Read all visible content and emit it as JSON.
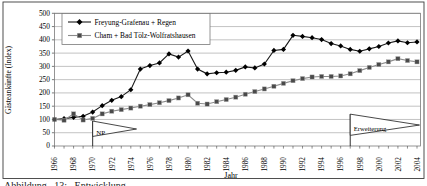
{
  "figure": {
    "caption_fragment": "Abbildung 13: Entwicklung"
  },
  "chart_data": {
    "type": "line",
    "title": "",
    "xlabel": "Jahr",
    "ylabel": "Gästeankünfte (Index)",
    "ylim": [
      0,
      500
    ],
    "ytick_step": 50,
    "grid": "horizontal",
    "legend_position": "top-left-inside",
    "x": [
      1966,
      1967,
      1968,
      1969,
      1970,
      1971,
      1972,
      1973,
      1974,
      1975,
      1976,
      1977,
      1978,
      1979,
      1980,
      1981,
      1982,
      1983,
      1984,
      1985,
      1986,
      1987,
      1988,
      1989,
      1990,
      1991,
      1992,
      1993,
      1994,
      1995,
      1996,
      1997,
      1998,
      1999,
      2000,
      2001,
      2002,
      2003,
      2004
    ],
    "xtick_labels": [
      1966,
      1968,
      1970,
      1972,
      1974,
      1976,
      1978,
      1980,
      1982,
      1984,
      1986,
      1988,
      1990,
      1992,
      1994,
      1996,
      1998,
      2000,
      2002,
      2004
    ],
    "series": [
      {
        "name": "Freyung-Grafenau + Regen",
        "marker": "diamond",
        "marker_color": "#000000",
        "line_color": "#1a1a1a",
        "values": [
          100,
          103,
          108,
          112,
          128,
          152,
          172,
          186,
          212,
          290,
          303,
          313,
          347,
          335,
          358,
          290,
          272,
          276,
          278,
          285,
          298,
          294,
          309,
          360,
          364,
          417,
          413,
          408,
          401,
          386,
          377,
          364,
          357,
          366,
          375,
          388,
          396,
          389,
          392
        ]
      },
      {
        "name": "Cham + Bad Tölz-Wolfratshausen",
        "marker": "square",
        "marker_color": "#4a4a4a",
        "line_color": "#8c8c8c",
        "values": [
          100,
          97,
          121,
          98,
          104,
          121,
          131,
          137,
          143,
          150,
          156,
          163,
          171,
          181,
          193,
          161,
          158,
          167,
          175,
          184,
          195,
          205,
          215,
          225,
          236,
          246,
          254,
          260,
          262,
          262,
          264,
          272,
          284,
          296,
          307,
          317,
          329,
          322,
          317
        ]
      }
    ],
    "annotations": [
      {
        "type": "flag",
        "label": "NP",
        "year": 1970,
        "flag_top_value": 94,
        "flag_bottom_value": 36,
        "tip_year": 1974.6,
        "tip_value": 64
      },
      {
        "type": "flag",
        "label": "Erweiterung",
        "year": 1997,
        "flag_top_value": 120,
        "flag_bottom_value": 40,
        "tip_year": 2004.3,
        "tip_value": 79
      }
    ]
  }
}
